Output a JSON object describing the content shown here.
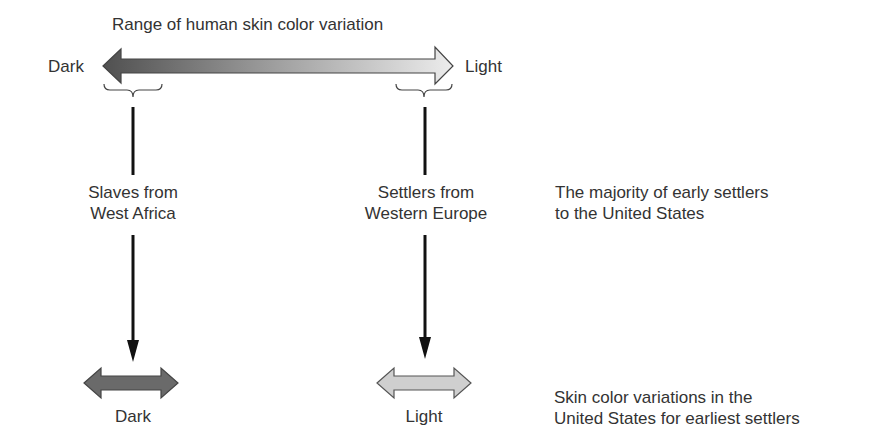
{
  "title": "Range of human skin color variation",
  "range_arrow": {
    "left_label": "Dark",
    "right_label": "Light",
    "dark_color": "#555555",
    "light_color": "#e6e6e6"
  },
  "sources": [
    {
      "line1": "Slaves from",
      "line2": "West Africa"
    },
    {
      "line1": "Settlers from",
      "line2": "Western Europe"
    }
  ],
  "side_notes": {
    "settlers_note_line1": "The majority of early settlers",
    "settlers_note_line2": "to the United States",
    "variation_note_line1": "Skin color variations in the",
    "variation_note_line2": "United States for earliest settlers"
  },
  "result_arrows": [
    {
      "label": "Dark",
      "color": "#6a6a6a"
    },
    {
      "label": "Light",
      "color": "#cfcfcf"
    }
  ]
}
